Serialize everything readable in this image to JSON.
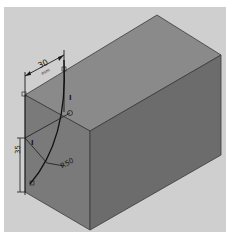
{
  "figure": {
    "type": "isometric engineering drawing",
    "colors": {
      "background": "#ffffff",
      "frame": "#cfcfcf",
      "top_face": "#8a8a8a",
      "left_face": "#7a7a7a",
      "right_face": "#6c6c6c",
      "lines": "#1a1a1a"
    }
  },
  "dimensions": {
    "width_label": "30",
    "width_unit": "mm",
    "height_label": "35",
    "radius_label": "R50"
  },
  "markers": {
    "constraint_1": "I",
    "constraint_2": "I"
  }
}
